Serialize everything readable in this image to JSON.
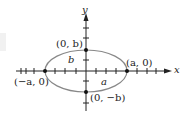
{
  "diagram": {
    "axes": {
      "x_label": "x",
      "y_label": "y"
    },
    "ellipse": {
      "semi_major_label": "a",
      "semi_minor_label": "b"
    },
    "points": {
      "right_vertex": "(a, 0)",
      "left_vertex": "(−a, 0)",
      "top_covertex": "(0, b)",
      "bottom_covertex": "(0, −b)"
    },
    "colors": {
      "ellipse_stroke": "#888888",
      "axis_stroke": "#222222",
      "point_fill": "#111111"
    }
  }
}
